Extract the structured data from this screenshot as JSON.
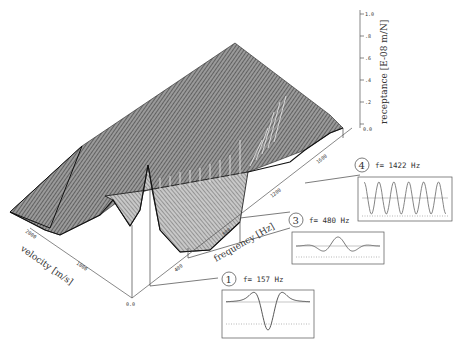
{
  "chart_data": {
    "type": "surface3d",
    "title": "",
    "axes": {
      "x": {
        "label": "frequency   [Hz]",
        "ticks": [
          "400",
          "800",
          "1200",
          "1600"
        ],
        "range": [
          0,
          1600
        ]
      },
      "y": {
        "label": "velocity   [m/s]",
        "ticks": [
          "0.0",
          "1000",
          "2000"
        ],
        "range": [
          0,
          2000
        ]
      },
      "z": {
        "label": "receptance   [E-08 m/N]",
        "ticks": [
          "0.0",
          ".2",
          ".4",
          ".6",
          ".8",
          "1.0"
        ],
        "range": [
          0,
          1.0
        ]
      }
    },
    "insets": [
      {
        "id": "1",
        "label": "f= 157 Hz",
        "frequency_hz": 157,
        "shape": "single-dip"
      },
      {
        "id": "3",
        "label": "f= 480 Hz",
        "frequency_hz": 480,
        "shape": "double-peak"
      },
      {
        "id": "4",
        "label": "f= 1422 Hz",
        "frequency_hz": 1422,
        "shape": "oscillation"
      }
    ],
    "grid": false,
    "legend": "none"
  }
}
